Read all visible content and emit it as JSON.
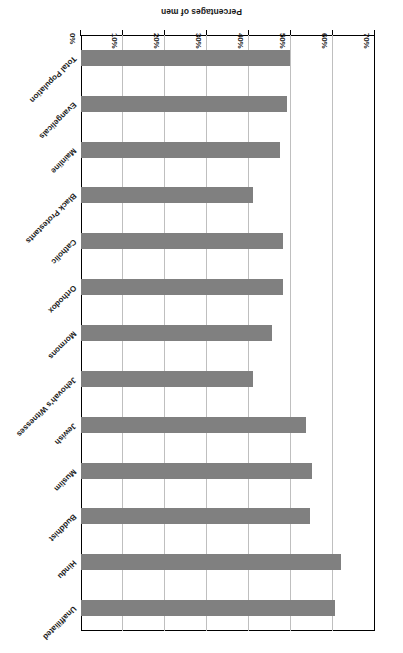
{
  "chart_data": {
    "type": "bar",
    "orientation": "horizontal",
    "title": "",
    "xlabel": "",
    "ylabel": "Percentages of men",
    "ylim": [
      0,
      70
    ],
    "grid": true,
    "legend": "none",
    "tick_labels": [
      "0%",
      "10%",
      "20%",
      "30%",
      "40%",
      "50%",
      "60%",
      "70%"
    ],
    "tick_values": [
      0,
      10,
      20,
      30,
      40,
      50,
      60,
      70
    ],
    "categories": [
      "Total Population",
      "Evangelicals",
      "Mainline",
      "Black Protestants",
      "Catholic",
      "Orthodox",
      "Mormons",
      "Jehovah's Witnesses",
      "Jewish",
      "Muslim",
      "Buddhist",
      "Hindu",
      "Unaffiliated"
    ],
    "values": [
      49.8,
      49,
      47.5,
      41,
      48,
      48,
      45.5,
      41,
      53.5,
      55,
      54.5,
      62,
      60.5
    ],
    "bar_color": "#808080",
    "gridline_color": "#bfbfbf",
    "axis_color": "#000000",
    "note": "Chart image is presented rotated 180 degrees in the source."
  }
}
